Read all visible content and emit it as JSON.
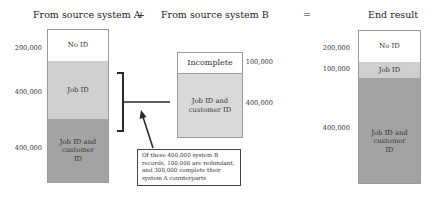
{
  "headers": {
    "source_a": "From source system A",
    "plus": "+",
    "source_b": "From source system B",
    "equals": "=",
    "end_result": "End result"
  },
  "column_a": {
    "segments": [
      {
        "label": "No ID",
        "count": "200,000",
        "shade": "white"
      },
      {
        "label": "Job ID",
        "count": "400,000",
        "shade": "light"
      },
      {
        "label": "Job ID and customer ID",
        "count": "400,000",
        "shade": "dark"
      }
    ]
  },
  "column_b": {
    "segments": [
      {
        "label": "Incomplete",
        "count": "100,000",
        "shade": "white"
      },
      {
        "label": "Job ID and customer ID",
        "count": "400,000",
        "shade": "light"
      }
    ]
  },
  "end_result": {
    "segments": [
      {
        "label": "No ID",
        "count": "200,000",
        "shade": "white"
      },
      {
        "label": "Job ID",
        "count": "100,000",
        "shade": "light"
      },
      {
        "label": "Job ID and customer ID",
        "count": "400,000",
        "shade": "dark"
      }
    ]
  },
  "callout": {
    "text": "Of these 400,000 system B records, 100,000 are redundant, and 300,000 complete their system A counterparts"
  },
  "colors": {
    "white": "#ffffff",
    "light": "#cfcfcf",
    "dark": "#a3a3a3",
    "line": "#2a2a2a"
  }
}
